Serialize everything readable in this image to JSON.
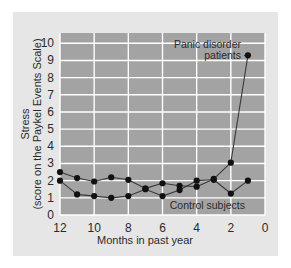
{
  "figure": {
    "background_color": "#e6e6e6",
    "page_background_color": "#ffffff",
    "plot_background_color": "#a3a3a3",
    "gridline_color": "#ffffff",
    "marker_color": "#111111",
    "line_color": "#3a3a3a"
  },
  "chart_data": {
    "type": "line",
    "title": "",
    "subtitle": "",
    "xlabel": "Months in past year",
    "ylabel_line1": "Stress",
    "ylabel_line2": "(score on the Paykel Events Scale)",
    "ylabel": "Stress (score on the Paykel Events Scale)",
    "x": [
      12,
      11,
      10,
      9,
      8,
      7,
      6,
      5,
      4,
      3,
      2,
      1
    ],
    "xlim": [
      12,
      0
    ],
    "ylim": [
      0,
      10.6
    ],
    "xticks": [
      12,
      10,
      8,
      6,
      4,
      2,
      0
    ],
    "xtick_labels": [
      "12",
      "10",
      "8",
      "6",
      "4",
      "2",
      "0"
    ],
    "yticks": [
      0,
      1,
      2,
      3,
      4,
      5,
      6,
      7,
      8,
      9,
      10
    ],
    "ytick_labels": [
      "0",
      "1",
      "2",
      "3",
      "4",
      "5",
      "6",
      "7",
      "8",
      "9",
      "10"
    ],
    "x_axis_reversed": true,
    "grid": "both",
    "grid_x_step": 2,
    "grid_y_step": 1,
    "legend": "inline annotations",
    "series": [
      {
        "name": "Panic disorder patients",
        "values": [
          2.5,
          2.15,
          1.95,
          2.2,
          2.05,
          1.55,
          1.85,
          1.7,
          1.65,
          2.1,
          3.05,
          9.3
        ]
      },
      {
        "name": "Control subjects",
        "values": [
          2.0,
          1.2,
          1.1,
          1.0,
          1.1,
          1.5,
          1.1,
          1.45,
          2.0,
          2.05,
          1.25,
          2.0
        ]
      }
    ],
    "annotations": [
      {
        "name": "panic-disorder-label",
        "text_line1": "Panic disorder",
        "text_line2": "patients",
        "text": "Panic disorder patients"
      },
      {
        "name": "control-subjects-label",
        "text_line1": "Control subjects",
        "text": "Control subjects"
      }
    ]
  }
}
